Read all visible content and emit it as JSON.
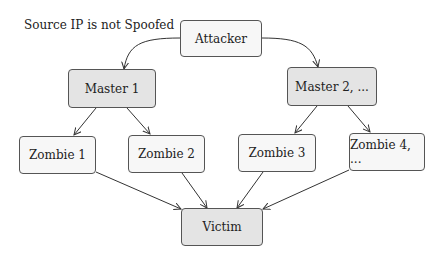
{
  "caption": "Source IP is not Spoofed",
  "nodes": {
    "attacker": {
      "label": "Attacker",
      "x": 180,
      "y": 20,
      "w": 82,
      "h": 37,
      "fill": "#f7f7f7"
    },
    "master1": {
      "label": "Master 1",
      "x": 68,
      "y": 69,
      "w": 88,
      "h": 39,
      "fill": "#e4e4e4"
    },
    "master2": {
      "label": "Master 2, ...",
      "x": 287,
      "y": 67,
      "w": 90,
      "h": 39,
      "fill": "#e4e4e4"
    },
    "zombie1": {
      "label": "Zombie 1",
      "x": 19,
      "y": 136,
      "w": 77,
      "h": 38,
      "fill": "#f7f7f7"
    },
    "zombie2": {
      "label": "Zombie 2",
      "x": 128,
      "y": 135,
      "w": 77,
      "h": 38,
      "fill": "#f7f7f7"
    },
    "zombie3": {
      "label": "Zombie 3",
      "x": 238,
      "y": 134,
      "w": 78,
      "h": 38,
      "fill": "#f7f7f7"
    },
    "zombie4": {
      "label": "Zombie 4, ...",
      "x": 349,
      "y": 133,
      "w": 76,
      "h": 38,
      "fill": "#f7f7f7"
    },
    "victim": {
      "label": "Victim",
      "x": 181,
      "y": 208,
      "w": 82,
      "h": 38,
      "fill": "#e4e4e4"
    }
  },
  "edges": [
    {
      "from": "attacker",
      "to": "master1"
    },
    {
      "from": "attacker",
      "to": "master2"
    },
    {
      "from": "master1",
      "to": "zombie1"
    },
    {
      "from": "master1",
      "to": "zombie2"
    },
    {
      "from": "master2",
      "to": "zombie3"
    },
    {
      "from": "master2",
      "to": "zombie4"
    },
    {
      "from": "zombie1",
      "to": "victim"
    },
    {
      "from": "zombie2",
      "to": "victim"
    },
    {
      "from": "zombie3",
      "to": "victim"
    },
    {
      "from": "zombie4",
      "to": "victim"
    }
  ]
}
